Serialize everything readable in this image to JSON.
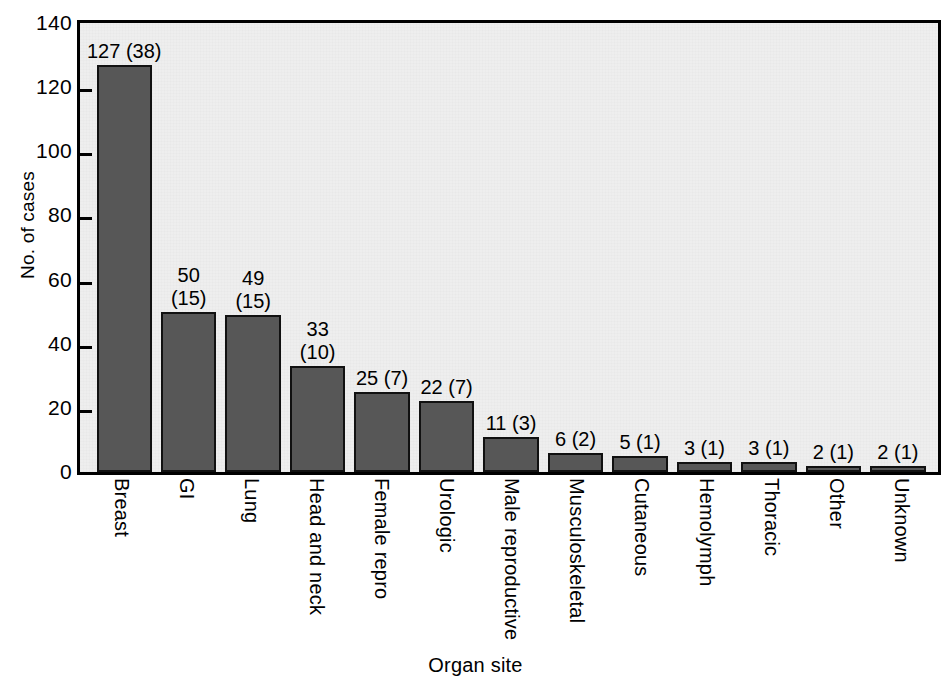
{
  "chart_data": {
    "type": "bar",
    "title": "",
    "xlabel": "Organ site",
    "ylabel": "No. of cases",
    "ylim": [
      0,
      140
    ],
    "ytick_step": 20,
    "yticks": [
      "140",
      "120",
      "100",
      "80",
      "60",
      "40",
      "20",
      "0"
    ],
    "grid": false,
    "legend": null,
    "categories": [
      "Breast",
      "GI",
      "Lung",
      "Head and neck",
      "Female repro",
      "Urologic",
      "Male reproductive",
      "Musculoskeletal",
      "Cutaneous",
      "Hemolymph",
      "Thoracic",
      "Other",
      "Unknown"
    ],
    "values": [
      127,
      50,
      49,
      33,
      25,
      22,
      11,
      6,
      5,
      3,
      3,
      2,
      2
    ],
    "secondary_values": [
      38,
      15,
      15,
      10,
      7,
      7,
      3,
      2,
      1,
      1,
      1,
      1,
      1
    ],
    "bar_labels": [
      "127 (38)",
      "50\n(15)",
      "49\n(15)",
      "33\n(10)",
      "25 (7)",
      "22 (7)",
      "11 (3)",
      "6 (2)",
      "5 (1)",
      "3 (1)",
      "3 (1)",
      "2 (1)",
      "2 (1)"
    ],
    "colors": {
      "bar_fill": "#575757",
      "bar_edge": "#111111",
      "plot_background": "#eeeeee",
      "axis": "#000000",
      "text": "#000000"
    }
  }
}
